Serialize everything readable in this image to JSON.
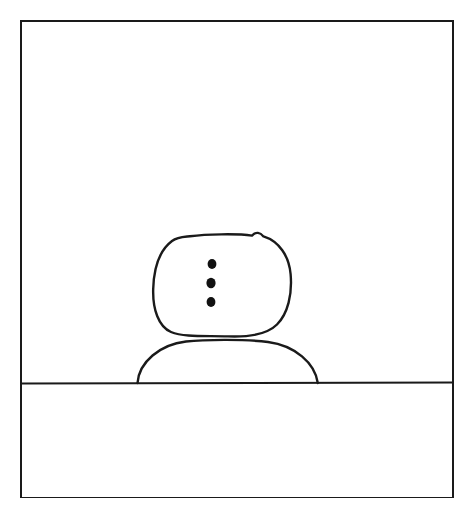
{
  "canvas": {
    "width": 476,
    "height": 526,
    "background_color": "#ffffff",
    "ink_color": "#1a1a1a",
    "title": "Hand-drawn snowman sketch"
  },
  "frame": {
    "label": "picture-frame-border",
    "x": 21,
    "y": 21,
    "width": 432,
    "height": 476,
    "stroke_width": 2,
    "stroke_color": "#1a1a1a",
    "fill": "none"
  },
  "horizon": {
    "label": "ground-horizon-line",
    "y": 383,
    "x_start": 22,
    "x_end": 453,
    "stroke_width": 2,
    "stroke_color": "#1a1a1a"
  },
  "snowman": {
    "label": "snowman",
    "stroke_color": "#1a1a1a",
    "stroke_width": 2.4,
    "head": {
      "label": "snowman-head-blob",
      "center_x": 222,
      "center_y": 285,
      "radius_x": 69,
      "radius_y": 51,
      "top_y": 234,
      "bottom_y": 336,
      "left_x": 153,
      "right_x": 291
    },
    "body": {
      "label": "snowman-body-mound",
      "left_x": 137,
      "right_x": 318,
      "base_y": 383,
      "top_y": 341,
      "center_x": 228
    },
    "buttons": [
      {
        "label": "button-top",
        "cx": 212,
        "cy": 264,
        "rx": 4.4,
        "ry": 5.0,
        "fill": "#111111"
      },
      {
        "label": "button-middle",
        "cx": 211,
        "cy": 283,
        "rx": 4.6,
        "ry": 5.2,
        "fill": "#111111"
      },
      {
        "label": "button-bottom",
        "cx": 211,
        "cy": 302,
        "rx": 4.4,
        "ry": 5.0,
        "fill": "#111111"
      }
    ]
  },
  "sky": {
    "label": "sky-region",
    "description": "empty white area above the horizon"
  },
  "ground": {
    "label": "ground-region",
    "description": "empty white area below the horizon"
  }
}
